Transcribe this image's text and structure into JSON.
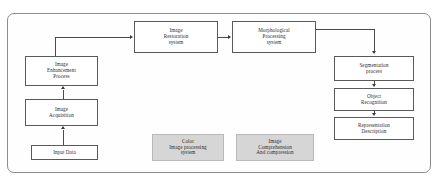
{
  "diagram": {
    "colors": {
      "frame_border": "#8d8d8d",
      "node_border": "#5a5a5a",
      "node_fill": "#ffffff",
      "shaded_fill": "#d6d6d6",
      "connector": "#4a4a4a",
      "text": "#2b2b2b",
      "background": "#ffffff"
    },
    "nodes": [
      {
        "id": "image_restoration",
        "label": "Image\nRestoration\nsystem",
        "shaded": false
      },
      {
        "id": "morphological",
        "label": "Morphological\nProcessing\nsystem",
        "shaded": false
      },
      {
        "id": "image_enhancement",
        "label": "Image\nEnhancement\nProcess",
        "shaded": false
      },
      {
        "id": "image_acquisition",
        "label": "Image\nAcquisition",
        "shaded": false
      },
      {
        "id": "input_data",
        "label": "Input Data",
        "shaded": false
      },
      {
        "id": "segmentation",
        "label": "Segmentation\nprocess",
        "shaded": false
      },
      {
        "id": "object_recognition",
        "label": "Object\nRecognition",
        "shaded": false
      },
      {
        "id": "representation",
        "label": "Representation\nDescription",
        "shaded": false
      },
      {
        "id": "color_image_processing",
        "label": "Color\nImage processing\nsystem",
        "shaded": true
      },
      {
        "id": "image_comprehension",
        "label": "Image\nComprehension\nAnd compression",
        "shaded": true
      }
    ],
    "edges": [
      {
        "from": "input_data",
        "to": "image_acquisition",
        "direction": "up"
      },
      {
        "from": "image_acquisition",
        "to": "image_enhancement",
        "direction": "up"
      },
      {
        "from": "image_enhancement",
        "to": "image_restoration",
        "direction": "up-right-elbow"
      },
      {
        "from": "image_restoration",
        "to": "morphological",
        "direction": "right"
      },
      {
        "from": "morphological",
        "to": "segmentation",
        "direction": "right-down-elbow"
      },
      {
        "from": "segmentation",
        "to": "object_recognition",
        "direction": "down"
      },
      {
        "from": "object_recognition",
        "to": "representation",
        "direction": "down"
      }
    ]
  }
}
